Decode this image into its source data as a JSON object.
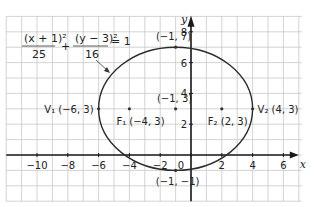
{
  "chart_data": {
    "type": "line",
    "title": "",
    "xlabel": "x",
    "ylabel": "y",
    "xlim": [
      -12,
      7
    ],
    "ylim": [
      -3,
      9
    ],
    "grid": true,
    "x_ticks": [
      -10,
      -8,
      -6,
      -4,
      -2,
      0,
      2,
      4,
      6
    ],
    "x_tick_labels": [
      "−10",
      "−8",
      "−6",
      "−4",
      "−2",
      "0",
      "2",
      "4",
      "6"
    ],
    "y_ticks": [
      2,
      4,
      6,
      8
    ],
    "y_tick_labels": [
      "2",
      "4",
      "6",
      "8"
    ],
    "ellipse": {
      "center": [
        -1,
        3
      ],
      "a": 5,
      "b": 4
    },
    "equation": {
      "num1": "(x + 1)²",
      "den1": "25",
      "plus": "+",
      "num2": "(y − 3)²",
      "den2": "16",
      "rhs": "= 1"
    },
    "points": [
      {
        "name": "V1",
        "x": -6,
        "y": 3,
        "label": "V₁ (−6, 3)"
      },
      {
        "name": "F1",
        "x": -4,
        "y": 3,
        "label": "F₁ (−4, 3)"
      },
      {
        "name": "center",
        "x": -1,
        "y": 3,
        "label": "(−1, 3)"
      },
      {
        "name": "F2",
        "x": 2,
        "y": 3,
        "label": "F₂ (2, 3)"
      },
      {
        "name": "V2",
        "x": 4,
        "y": 3,
        "label": "V₂ (4, 3)"
      },
      {
        "name": "top",
        "x": -1,
        "y": 7,
        "label": "(−1, 7)"
      },
      {
        "name": "bottom",
        "x": -1,
        "y": -1,
        "label": "(−1, −1)"
      }
    ]
  }
}
